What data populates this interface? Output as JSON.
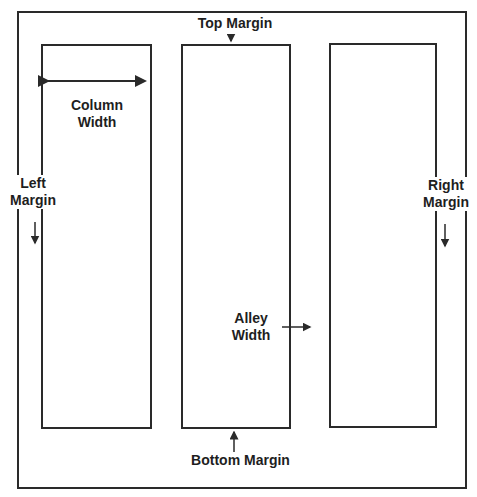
{
  "diagram": {
    "type": "page-layout",
    "colors": {
      "line": "#2a2a2a",
      "text": "#1e1e1e",
      "background": "#ffffff"
    },
    "columns": [
      {
        "id": "column-1"
      },
      {
        "id": "column-2"
      },
      {
        "id": "column-3"
      }
    ],
    "labels": {
      "top_margin": "Top Margin",
      "column_width_line1": "Column",
      "column_width_line2": "Width",
      "left_margin_line1": "Left",
      "left_margin_line2": "Margin",
      "right_margin_line1": "Right",
      "right_margin_line2": "Margin",
      "alley_width_line1": "Alley",
      "alley_width_line2": "Width",
      "bottom_margin": "Bottom Margin"
    }
  }
}
